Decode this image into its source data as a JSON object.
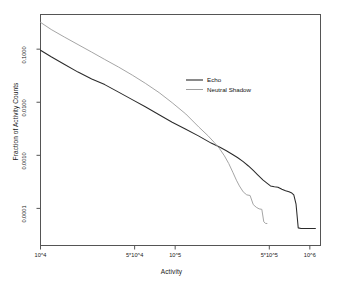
{
  "chart_data": {
    "type": "line",
    "title": "",
    "xlabel": "Activity",
    "ylabel": "Fraction of Activity Counts",
    "xscale": "log",
    "yscale": "log",
    "grid": false,
    "xlim": [
      10000,
      1200000
    ],
    "ylim": [
      2e-05,
      0.45
    ],
    "xticks": [
      10000,
      50000,
      100000,
      500000,
      1000000
    ],
    "xticklabels": [
      "10^4",
      "5*10^4",
      "10^5",
      "5*10^5",
      "10^6"
    ],
    "yticks": [
      0.1,
      0.01,
      0.001,
      0.0001
    ],
    "yticklabels": [
      "0.1000",
      "0.0100",
      "0.0010",
      "0.0001"
    ],
    "legend_position": "center-right",
    "series": [
      {
        "name": "Echo",
        "color": "#2b2b2b",
        "x": [
          10000,
          12000,
          15000,
          19000,
          24000,
          30000,
          38000,
          48000,
          60000,
          76000,
          95000,
          120000,
          150000,
          185000,
          215000,
          240000,
          265000,
          290000,
          320000,
          350000,
          380000,
          410000,
          450000,
          480000,
          510000,
          545000,
          580000,
          620000,
          660000,
          700000,
          735000,
          760000,
          790000,
          820000,
          860000,
          900000,
          1000000,
          1100000
        ],
        "y": [
          0.0955,
          0.072,
          0.052,
          0.037,
          0.0275,
          0.0215,
          0.0155,
          0.0112,
          0.0082,
          0.0058,
          0.0042,
          0.0031,
          0.0023,
          0.0017,
          0.00142,
          0.00122,
          0.00105,
          0.00091,
          0.00076,
          0.00063,
          0.00052,
          0.00043,
          0.00034,
          0.0003,
          0.000265,
          0.000255,
          0.00025,
          0.00023,
          0.000215,
          0.000205,
          0.000195,
          0.00018,
          0.00012,
          4.3e-05,
          4.2e-05,
          4.2e-05,
          4.2e-05,
          4.2e-05
        ]
      },
      {
        "name": "Neutral Shadow",
        "color": "#a0a0a0",
        "x": [
          10000,
          12000,
          15000,
          19000,
          24000,
          30000,
          38000,
          48000,
          60000,
          76000,
          95000,
          120000,
          150000,
          175000,
          195000,
          213000,
          232000,
          250000,
          268000,
          285000,
          300000,
          320000,
          340000,
          360000,
          380000,
          400000,
          420000,
          440000,
          455000,
          470000,
          480000
        ],
        "y": [
          0.32,
          0.235,
          0.17,
          0.122,
          0.088,
          0.064,
          0.046,
          0.0325,
          0.0228,
          0.0152,
          0.0098,
          0.006,
          0.0034,
          0.00235,
          0.00175,
          0.00135,
          0.00098,
          0.0007,
          0.00048,
          0.00034,
          0.000265,
          0.000205,
          0.00018,
          0.000175,
          0.000118,
          0.000105,
          9.8e-05,
          9.6e-05,
          5.6e-05,
          5.2e-05,
          5.2e-05
        ]
      }
    ]
  },
  "legend": {
    "entries": [
      {
        "label": "Echo",
        "color": "#2b2b2b"
      },
      {
        "label": "Neutral Shadow",
        "color": "#a0a0a0"
      }
    ]
  },
  "axes": {
    "frame_color": "#555555"
  }
}
